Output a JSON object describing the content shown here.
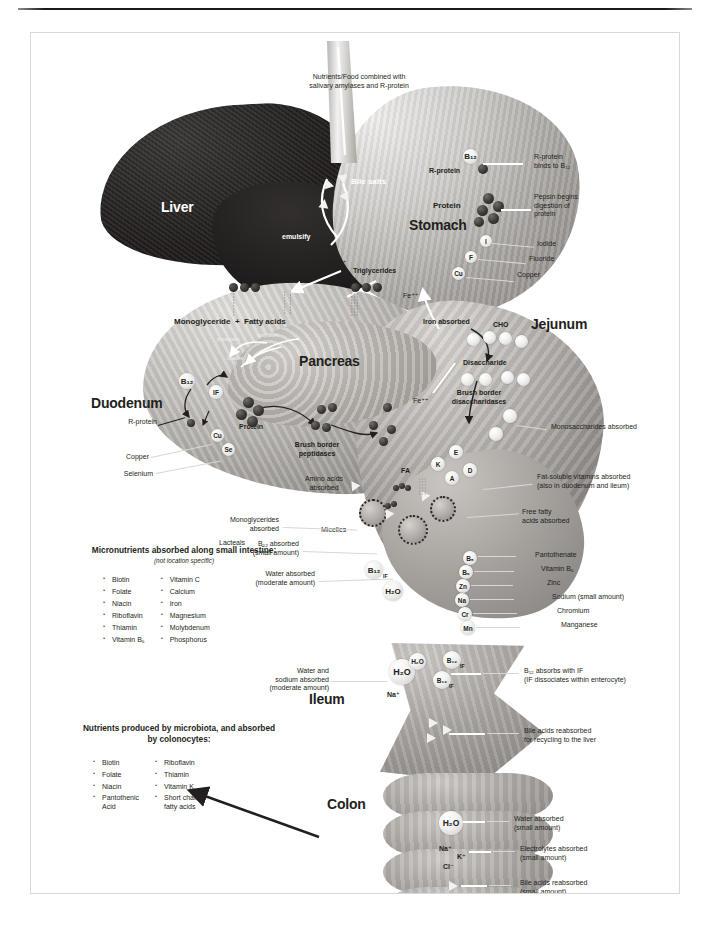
{
  "figure": {
    "organs": {
      "liver": "Liver",
      "stomach": "Stomach",
      "pancreas": "Pancreas",
      "duodenum": "Duodenum",
      "jejunum": "Jejunum",
      "ileum": "Ileum",
      "colon": "Colon"
    },
    "top_caption": "Nutrients/Food combined with\nsalivary amylases and R-protein",
    "stomach_annotations": [
      {
        "label": "R-protein\nbinds to B₁₂"
      },
      {
        "label": "Pepsin begins\ndigestion of\nprotein"
      },
      {
        "label": "Iodide"
      },
      {
        "label": "Fluoride"
      },
      {
        "label": "Copper"
      }
    ],
    "stomach_inline": [
      {
        "text": "B₁₂"
      },
      {
        "text": "R-protein"
      },
      {
        "text": "Protein"
      },
      {
        "text": "I"
      },
      {
        "text": "F"
      },
      {
        "text": "Cu"
      },
      {
        "text": "Fe⁺⁺⁺"
      },
      {
        "text": "Fe⁺⁺"
      }
    ],
    "liver_inline": [
      {
        "text": "Bile salts"
      },
      {
        "text": "emulsify"
      }
    ],
    "duodenum_inline": [
      {
        "text": "Triglycerides"
      },
      {
        "text": "Monoglyceride  +  Fatty acids"
      },
      {
        "text": "proteases"
      },
      {
        "text": "amylases"
      },
      {
        "text": "lipases"
      },
      {
        "text": "B₁₂"
      },
      {
        "text": "IF"
      },
      {
        "text": "Protein"
      },
      {
        "text": "Brush border\npeptidases"
      },
      {
        "text": "Amino acids\nabsorbed"
      },
      {
        "text": "Micelles"
      },
      {
        "text": "Lacteals"
      },
      {
        "text": "FA"
      }
    ],
    "duodenum_annotations": [
      {
        "label": "R-protein"
      },
      {
        "label": "Copper"
      },
      {
        "label": "Selenium"
      },
      {
        "label": "Iron absorbed"
      },
      {
        "label": "Monoglycerides\nabsorbed"
      },
      {
        "label": "B₁₂ absorbed\n(small amount)"
      },
      {
        "label": "Water absorbed\n(moderate amount)"
      }
    ],
    "jejunum_inline": [
      {
        "text": "CHO"
      },
      {
        "text": "Disaccharide"
      },
      {
        "text": "Brush border\ndisaccharidases"
      },
      {
        "text": "K"
      },
      {
        "text": "E"
      },
      {
        "text": "A"
      },
      {
        "text": "D"
      },
      {
        "text": "B₅"
      },
      {
        "text": "B₆"
      },
      {
        "text": "Zn"
      },
      {
        "text": "Na"
      },
      {
        "text": "Cr"
      },
      {
        "text": "Mn"
      },
      {
        "text": "H₂O"
      },
      {
        "text": "B₁₂"
      },
      {
        "text": "IF"
      },
      {
        "text": "Fe⁺⁺"
      }
    ],
    "jejunum_annotations": [
      {
        "label": "Monosaccharides absorbed"
      },
      {
        "label": "Fat-soluble vitamins absorbed\n(also in duodenum and ileum)"
      },
      {
        "label": "Free fatty\nacids absorbed"
      },
      {
        "label": "Pantothenate"
      },
      {
        "label": "Vitamin B₆"
      },
      {
        "label": "Zinc"
      },
      {
        "label": "Sodium (small amount)"
      },
      {
        "label": "Chromium"
      },
      {
        "label": "Manganese"
      }
    ],
    "ileum_inline": [
      {
        "text": "H₂O"
      },
      {
        "text": "Na⁺"
      },
      {
        "text": "B₁₂"
      },
      {
        "text": "IF"
      }
    ],
    "ileum_annotations": [
      {
        "label": "Water and\nsodium absorbed\n(moderate amount)"
      },
      {
        "label": "B₁₂ absorbs with IF\n(IF dissociates within enterocyte)"
      },
      {
        "label": "Bile acids reabsorbed\nfor recycling to the liver"
      }
    ],
    "colon_inline": [
      {
        "text": "H₂O"
      },
      {
        "text": "Na⁺"
      },
      {
        "text": "K⁺"
      },
      {
        "text": "Cl⁻"
      }
    ],
    "colon_annotations": [
      {
        "label": "Water absorbed\n(small amount)"
      },
      {
        "label": "Electrolytes absorbed\n(small amount)"
      },
      {
        "label": "Bile acids reabsorbed\n(small amount)"
      }
    ],
    "micronutrient_box": {
      "title": "Micronutrients absorbed\nalong small intestine:",
      "subtitle": "(not location specific)",
      "column1": [
        "Biotin",
        "Folate",
        "Niacin",
        "Riboflavin",
        "Thiamin",
        "Vitamin B₆"
      ],
      "column2": [
        "Vitamin C",
        "Calcium",
        "Iron",
        "Magnesium",
        "Molybdenum",
        "Phosphorus"
      ]
    },
    "microbiota_box": {
      "title": "Nutrients produced by\nmicrobiota, and absorbed\nby colonocytes:",
      "column1": [
        "Biotin",
        "Folate",
        "Niacin",
        "Pantothenic\nAcid"
      ],
      "column2": [
        "Riboflavin",
        "Thiamin",
        "Vitamin K",
        "Short chain\nfatty acids"
      ]
    }
  }
}
